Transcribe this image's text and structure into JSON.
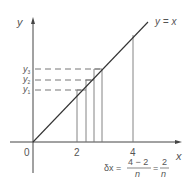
{
  "diagram": {
    "title": "",
    "axes": {
      "x_label": "x",
      "y_label": "y",
      "origin_label": "0",
      "x_ticks": [
        "2",
        "4"
      ]
    },
    "line_label": "y = x",
    "y_markers": [
      {
        "label": "y",
        "sub": "3"
      },
      {
        "label": "y",
        "sub": "2"
      },
      {
        "label": "y",
        "sub": "1"
      }
    ],
    "formula": {
      "lhs": "δx =",
      "frac1_num": "4 − 2",
      "frac1_den": "n",
      "eq": "=",
      "frac2_num": "2",
      "frac2_den": "n"
    },
    "colors": {
      "axis": "#444444",
      "line": "#333333",
      "gridline": "#777777",
      "text": "#555555"
    }
  }
}
